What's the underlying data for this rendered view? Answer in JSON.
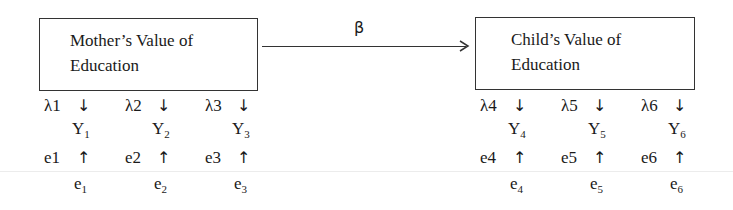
{
  "diagram": {
    "type": "structural-equation-path-diagram",
    "path_label": "β",
    "latent_left": {
      "line1": "Mother’s Value of",
      "line2": "Education"
    },
    "latent_right": {
      "line1": "Child’s Value of",
      "line2": "Education"
    },
    "indicators": [
      {
        "loading": "λ1",
        "y": "Y",
        "y_sub": "1",
        "error_label": "e1",
        "e": "e",
        "e_sub": "1"
      },
      {
        "loading": "λ2",
        "y": "Y",
        "y_sub": "2",
        "error_label": "e2",
        "e": "e",
        "e_sub": "2"
      },
      {
        "loading": "λ3",
        "y": "Y",
        "y_sub": "3",
        "error_label": "e3",
        "e": "e",
        "e_sub": "3"
      },
      {
        "loading": "λ4",
        "y": "Y",
        "y_sub": "4",
        "error_label": "e4",
        "e": "e",
        "e_sub": "4"
      },
      {
        "loading": "λ5",
        "y": "Y",
        "y_sub": "5",
        "error_label": "e5",
        "e": "e",
        "e_sub": "5"
      },
      {
        "loading": "λ6",
        "y": "Y",
        "y_sub": "6",
        "error_label": "e6",
        "e": "e",
        "e_sub": "6"
      }
    ],
    "down_arrow": "↓",
    "up_arrow": "↑"
  }
}
